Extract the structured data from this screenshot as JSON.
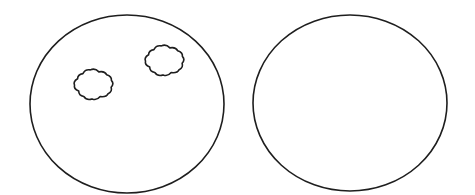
{
  "figure": {
    "width": 475,
    "height": 195,
    "stroke_color": "#1e1e1e",
    "background": "#ffffff",
    "panels": [
      {
        "id": "left",
        "shape": "ellipse",
        "cx": 127,
        "cy": 104,
        "rx": 97,
        "ry": 89,
        "spots": [
          {
            "shape": "cloud",
            "x": 73,
            "y": 68,
            "w": 41,
            "h": 33
          },
          {
            "shape": "cloud",
            "x": 144,
            "y": 44,
            "w": 41,
            "h": 33
          }
        ]
      },
      {
        "id": "right",
        "shape": "ellipse",
        "cx": 350,
        "cy": 103,
        "rx": 97,
        "ry": 88,
        "spots": []
      }
    ]
  }
}
